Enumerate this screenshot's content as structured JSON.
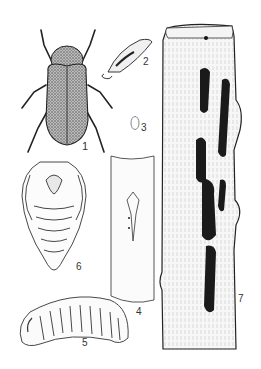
{
  "figure": {
    "type": "entomological illustration plate",
    "labels": {
      "adult": "1",
      "antenna_detail": "2",
      "egg": "3",
      "twig_with_egg_site": "4",
      "larva": "5",
      "pupa": "6",
      "wood_with_galleries": "7"
    },
    "colors": {
      "ink": "#1a1a1a",
      "background": "#ffffff",
      "shade": "#555555"
    }
  }
}
